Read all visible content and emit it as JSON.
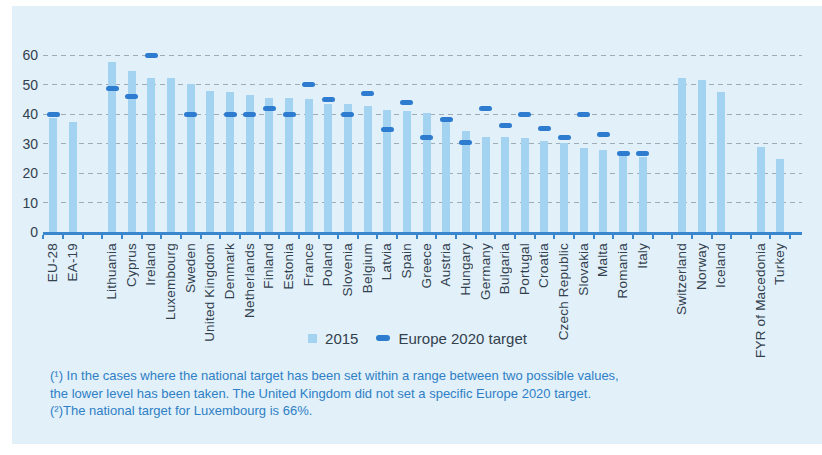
{
  "colors": {
    "panel_background": "#e1f0f9",
    "bar": "#a4d2f1",
    "target_dash": "#2e7cd0",
    "axis_line": "#3b87cf",
    "gridline": "#93a1ab",
    "axis_text": "#33404e",
    "footnote_text": "#2f7fc6"
  },
  "chart_data": {
    "type": "bar",
    "title": "",
    "xlabel": "",
    "ylabel": "",
    "unit": "%",
    "ylim": [
      0,
      60
    ],
    "yticks": [
      0,
      10,
      20,
      30,
      40,
      50,
      60
    ],
    "grid": "horizontal-dashed",
    "legend_position": "bottom-center",
    "legend": [
      {
        "label": "2015",
        "swatch": "light-blue-square",
        "color": "#a4d2f1"
      },
      {
        "label": "Europe 2020 target",
        "swatch": "dark-blue-dash",
        "color": "#2e7cd0"
      }
    ],
    "bars": [
      {
        "label": "EU-28",
        "value_2015": 38.7,
        "target_2020": 40
      },
      {
        "label": "EA-19",
        "value_2015": 37.3,
        "target_2020": null
      },
      {
        "label": "Lithuania",
        "value_2015": 57.6,
        "target_2020": 48.7,
        "gap_before": true
      },
      {
        "label": "Cyprus",
        "value_2015": 54.6,
        "target_2020": 46
      },
      {
        "label": "Ireland",
        "value_2015": 52.3,
        "target_2020": 60
      },
      {
        "label": "Luxembourg",
        "value_2015": 52.3,
        "target_2020": null
      },
      {
        "label": "Sweden",
        "value_2015": 50.2,
        "target_2020": 40
      },
      {
        "label": "United Kingdom",
        "value_2015": 47.9,
        "target_2020": null
      },
      {
        "label": "Denmark",
        "value_2015": 47.6,
        "target_2020": 40
      },
      {
        "label": "Netherlands",
        "value_2015": 46.3,
        "target_2020": 40
      },
      {
        "label": "Finland",
        "value_2015": 45.5,
        "target_2020": 42
      },
      {
        "label": "Estonia",
        "value_2015": 45.3,
        "target_2020": 40
      },
      {
        "label": "France",
        "value_2015": 45.1,
        "target_2020": 50
      },
      {
        "label": "Poland",
        "value_2015": 43.4,
        "target_2020": 45
      },
      {
        "label": "Slovenia",
        "value_2015": 43.4,
        "target_2020": 40
      },
      {
        "label": "Belgium",
        "value_2015": 42.7,
        "target_2020": 47
      },
      {
        "label": "Latvia",
        "value_2015": 41.3,
        "target_2020": 34.7
      },
      {
        "label": "Spain",
        "value_2015": 40.9,
        "target_2020": 44
      },
      {
        "label": "Greece",
        "value_2015": 40.4,
        "target_2020": 32
      },
      {
        "label": "Austria",
        "value_2015": 38.7,
        "target_2020": 38
      },
      {
        "label": "Hungary",
        "value_2015": 34.3,
        "target_2020": 30.3
      },
      {
        "label": "Germany",
        "value_2015": 32.3,
        "target_2020": 42
      },
      {
        "label": "Bulgaria",
        "value_2015": 32.1,
        "target_2020": 36
      },
      {
        "label": "Portugal",
        "value_2015": 31.9,
        "target_2020": 40
      },
      {
        "label": "Croatia",
        "value_2015": 30.9,
        "target_2020": 35
      },
      {
        "label": "Czech Republic",
        "value_2015": 30.1,
        "target_2020": 32
      },
      {
        "label": "Slovakia",
        "value_2015": 28.4,
        "target_2020": 40
      },
      {
        "label": "Malta",
        "value_2015": 27.8,
        "target_2020": 33
      },
      {
        "label": "Romania",
        "value_2015": 25.6,
        "target_2020": 26.7
      },
      {
        "label": "Italy",
        "value_2015": 25.3,
        "target_2020": 26.5
      },
      {
        "label": "Switzerland",
        "value_2015": 52.3,
        "target_2020": null,
        "gap_before": true
      },
      {
        "label": "Norway",
        "value_2015": 51.6,
        "target_2020": null
      },
      {
        "label": "Iceland",
        "value_2015": 47.5,
        "target_2020": null
      },
      {
        "label": "FYR of Macedonia",
        "value_2015": 28.9,
        "target_2020": null,
        "gap_before": true
      },
      {
        "label": "Turkey",
        "value_2015": 24.8,
        "target_2020": null
      }
    ]
  },
  "footnotes": {
    "line1": "(¹) In the cases where the national target has been set within a range between two possible values,",
    "line2": "the lower level has been taken. The United Kingdom did not set a specific Europe 2020 target.",
    "line3": "(²)The national target for Luxembourg is 66%."
  }
}
